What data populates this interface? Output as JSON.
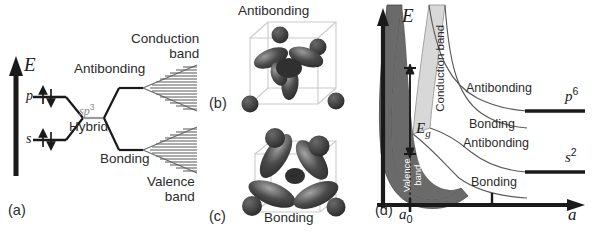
{
  "figure": {
    "type": "scientific-diagram"
  },
  "panel_a": {
    "tag": "(a)",
    "axis_label": "E",
    "atomic_levels": [
      {
        "name": "p",
        "label": "p",
        "electrons": "up-down-pair"
      },
      {
        "name": "s",
        "label": "s",
        "electrons": "up-down-pair"
      }
    ],
    "hybrid_label_sup": "sp",
    "hybrid_label_exp": "3",
    "hybrid_label_text": "Hybrid",
    "antibonding_label": "Antibonding",
    "bonding_label": "Bonding",
    "conduction_band_label_line1": "Conduction",
    "conduction_band_label_line2": "band",
    "valence_band_label_line1": "Valence",
    "valence_band_label_line2": "band"
  },
  "panel_b": {
    "tag": "(b)",
    "title": "Antibonding",
    "atom_count": 5,
    "lobe_count": 4
  },
  "panel_c": {
    "tag": "(c)",
    "title": "Bonding",
    "atom_count": 4,
    "lobe_count": 4
  },
  "panel_d": {
    "tag": "(d)",
    "y_axis_label": "E",
    "x_axis_label": "a",
    "x_tick_label": "a",
    "x_tick_sub": "0",
    "gap_label_base": "E",
    "gap_label_sub": "g",
    "conduction_band_label": "Conduction band",
    "valence_band_label_line1": "Valence",
    "valence_band_label_line2": "band",
    "curve_labels": [
      "Antibonding",
      "Bonding",
      "Antibonding",
      "Bonding"
    ],
    "right_level_upper_base": "p",
    "right_level_upper_exp": "6",
    "right_level_lower_base": "s",
    "right_level_lower_exp": "2"
  },
  "colors": {
    "ink": "#1a1a1a",
    "text": "#2b2b2b",
    "gray_text": "#8a8a8a",
    "valence_fill": "#6a6a6a",
    "conduction_fill": "#d8d8d8",
    "orbital_dark": "#3a3a3a",
    "orbital_mid": "#555555",
    "cube_line": "#c9c9c9",
    "band_line": "#555555"
  }
}
